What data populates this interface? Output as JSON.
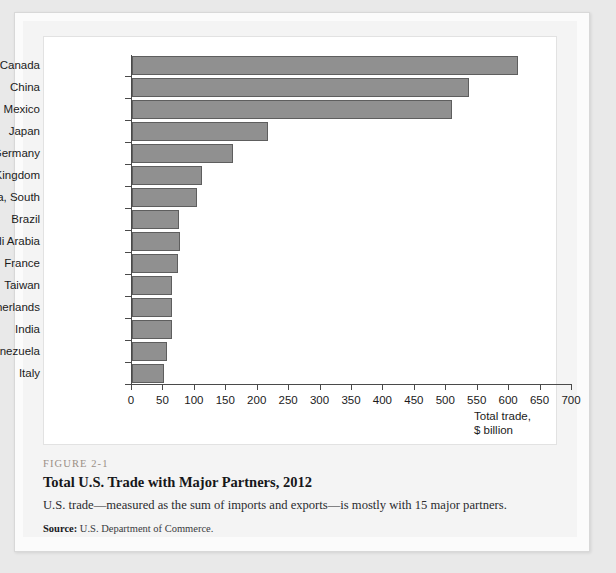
{
  "figure": {
    "number": "FIGURE 2-1",
    "title": "Total U.S. Trade with Major Partners, 2012",
    "description": "U.S. trade—measured as the sum of imports and exports—is mostly with 15 major partners.",
    "source_label": "Source:",
    "source_text": "U.S. Department of Commerce."
  },
  "chart_data": {
    "type": "bar",
    "orientation": "horizontal",
    "title": "Total U.S. Trade with Major Partners, 2012",
    "xlabel": "Total trade, $ billion",
    "ylabel": "",
    "xlim": [
      0,
      700
    ],
    "xticks": [
      0,
      50,
      100,
      150,
      200,
      250,
      300,
      350,
      400,
      450,
      500,
      550,
      600,
      650,
      700
    ],
    "grid": false,
    "legend": false,
    "bar_color": "#909090",
    "bar_edge_color": "#5e5e5e",
    "categories": [
      "Canada",
      "China",
      "Mexico",
      "Japan",
      "Germany",
      "United Kingdom",
      "Korea, South",
      "Brazil",
      "Saudi Arabia",
      "France",
      "Taiwan",
      "Netherlands",
      "India",
      "Venezuela",
      "Italy"
    ],
    "values": [
      614,
      536,
      509,
      216,
      161,
      111,
      103,
      74,
      76,
      73,
      64,
      64,
      64,
      56,
      51
    ],
    "axis_caption_lines": [
      "Total trade,",
      "$ billion"
    ]
  }
}
